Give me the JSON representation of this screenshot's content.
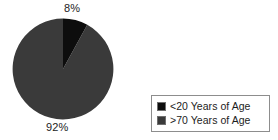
{
  "chart_data": {
    "type": "pie",
    "title": "",
    "categories": [
      "<20 Years of Age",
      ">70 Years of Age"
    ],
    "values": [
      8,
      92
    ],
    "value_labels": [
      "8%",
      "92%"
    ],
    "unit": "percent",
    "colors": [
      "#0d0d0d",
      "#3a3a3a"
    ],
    "start_angle": 0,
    "direction": "clockwise",
    "legend_position": "right-bottom",
    "grid": false,
    "background": "#ffffff"
  },
  "labels": {
    "small_slice": "8%",
    "large_slice": "92%"
  },
  "legend": {
    "items": [
      {
        "label": "<20 Years of Age",
        "color": "#0d0d0d"
      },
      {
        "label": ">70 Years of Age",
        "color": "#3a3a3a"
      }
    ]
  }
}
